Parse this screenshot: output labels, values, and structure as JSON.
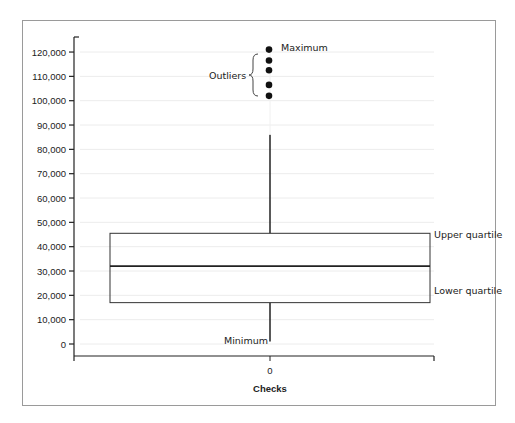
{
  "chart_data": {
    "type": "box",
    "title": "",
    "xlabel": "Checks",
    "ylabel": "",
    "categories": [
      "0"
    ],
    "ylim": [
      -5000,
      125000
    ],
    "yticks": [
      "120,000",
      "110,000",
      "100,000",
      "90,000",
      "80,000",
      "70,000",
      "60,000",
      "50,000",
      "40,000",
      "30,000",
      "20,000",
      "10,000",
      "0"
    ],
    "ytick_values": [
      120000,
      110000,
      100000,
      90000,
      80000,
      70000,
      60000,
      50000,
      40000,
      30000,
      20000,
      10000,
      0
    ],
    "grid": true,
    "series": [
      {
        "name": "Checks",
        "whisker_min": 1000,
        "q1": 17000,
        "median": 32000,
        "q3": 45500,
        "whisker_max": 86000,
        "outliers": [
          121000,
          116500,
          112500,
          106500,
          102000
        ]
      }
    ],
    "annotations": {
      "maximum": "Maximum",
      "outliers": "Outliers",
      "upper_quartile": "Upper quartile",
      "lower_quartile": "Lower quartile",
      "minimum": "Minimum"
    }
  }
}
